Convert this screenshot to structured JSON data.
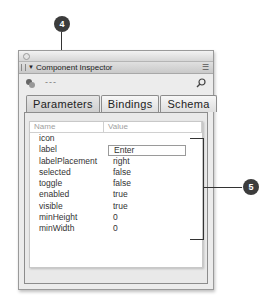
{
  "window": {
    "panel_title": "Component Inspector",
    "component_name": "---",
    "icons": {
      "collapse": "triangle-down-icon",
      "menu": "panel-menu-icon",
      "component": "component-icon",
      "pin": "pin-icon"
    }
  },
  "tabs": [
    {
      "label": "Parameters",
      "active": true
    },
    {
      "label": "Bindings",
      "active": false
    },
    {
      "label": "Schema",
      "active": false
    }
  ],
  "table": {
    "columns": [
      "Name",
      "Value"
    ],
    "rows": [
      {
        "name": "icon",
        "value": ""
      },
      {
        "name": "label",
        "value": "Enter"
      },
      {
        "name": "labelPlacement",
        "value": "right"
      },
      {
        "name": "selected",
        "value": "false"
      },
      {
        "name": "toggle",
        "value": "false"
      },
      {
        "name": "enabled",
        "value": "true"
      },
      {
        "name": "visible",
        "value": "true"
      },
      {
        "name": "minHeight",
        "value": "0"
      },
      {
        "name": "minWidth",
        "value": "0"
      }
    ]
  },
  "callouts": [
    {
      "number": "4"
    },
    {
      "number": "5"
    }
  ]
}
